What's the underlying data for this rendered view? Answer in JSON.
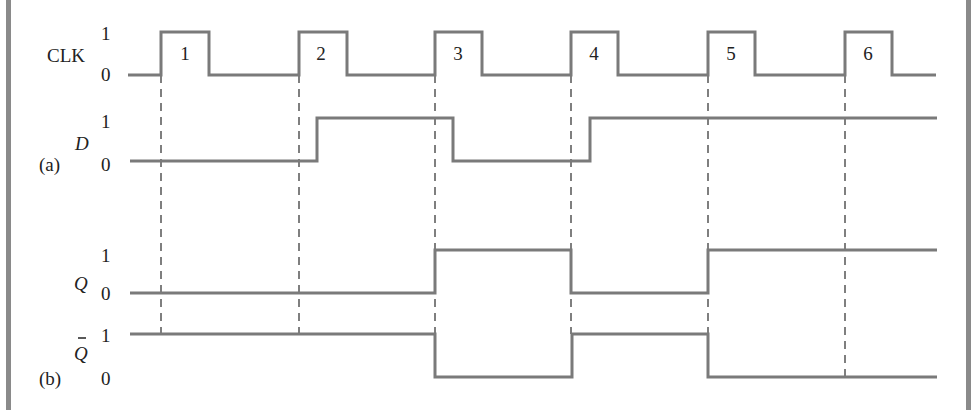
{
  "figure": {
    "type": "timing-diagram",
    "colors": {
      "trace": "#7a7a7a",
      "dash": "#555555",
      "text": "#222222",
      "border": "#8a8a8a"
    },
    "labels": {
      "clk": "CLK",
      "d": "D",
      "q": "Q",
      "qbar": "Q",
      "part_a": "(a)",
      "part_b": "(b)",
      "one": "1",
      "zero": "0"
    },
    "clock_pulses": [
      "1",
      "2",
      "3",
      "4",
      "5",
      "6"
    ],
    "signals": [
      {
        "name": "CLK",
        "levels_per_interval": "pulses 1-6 on rising edges"
      },
      {
        "name": "D",
        "transitions": [
          {
            "after_pulse": 2,
            "to": 1
          },
          {
            "after_pulse": 3,
            "to": 0
          },
          {
            "after_pulse": 4,
            "to": 1
          }
        ]
      },
      {
        "name": "Q",
        "transitions": [
          {
            "at_pulse": 3,
            "to": 1
          },
          {
            "at_pulse": 4,
            "to": 0
          },
          {
            "at_pulse": 5,
            "to": 1
          }
        ]
      },
      {
        "name": "Q-bar",
        "transitions": [
          {
            "at_pulse": 3,
            "to": 0
          },
          {
            "at_pulse": 4,
            "to": 1
          },
          {
            "at_pulse": 5,
            "to": 0
          }
        ]
      }
    ]
  }
}
